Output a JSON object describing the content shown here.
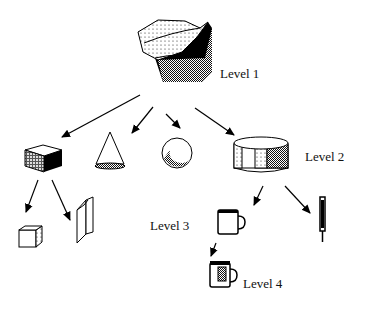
{
  "diagram": {
    "type": "hierarchy-tree",
    "levels": [
      {
        "label": "Level 1",
        "nodes": [
          "complex-solid"
        ]
      },
      {
        "label": "Level 2",
        "nodes": [
          "box",
          "cone",
          "sphere",
          "cylinder"
        ]
      },
      {
        "label": "Level 3",
        "nodes": [
          "small-box",
          "book",
          "mug",
          "pen"
        ]
      },
      {
        "label": "Level 4",
        "nodes": [
          "decorated-mug"
        ]
      }
    ],
    "edges": [
      [
        "complex-solid",
        "box"
      ],
      [
        "complex-solid",
        "cone"
      ],
      [
        "complex-solid",
        "sphere"
      ],
      [
        "complex-solid",
        "cylinder"
      ],
      [
        "box",
        "small-box"
      ],
      [
        "box",
        "book"
      ],
      [
        "cylinder",
        "mug"
      ],
      [
        "cylinder",
        "pen"
      ],
      [
        "mug",
        "decorated-mug"
      ]
    ]
  },
  "labels": {
    "level1": "Level 1",
    "level2": "Level 2",
    "level3": "Level 3",
    "level4": "Level 4"
  }
}
